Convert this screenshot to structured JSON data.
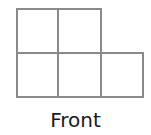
{
  "diagram": {
    "view_label": "Front",
    "line_color": "#8a8a8a",
    "grid": {
      "description": "Front view of a stacked cube arrangement",
      "rows": [
        {
          "row": "top",
          "cells": [
            1,
            1,
            0
          ]
        },
        {
          "row": "bottom",
          "cells": [
            1,
            1,
            1
          ]
        }
      ],
      "cell_count": 5
    }
  }
}
